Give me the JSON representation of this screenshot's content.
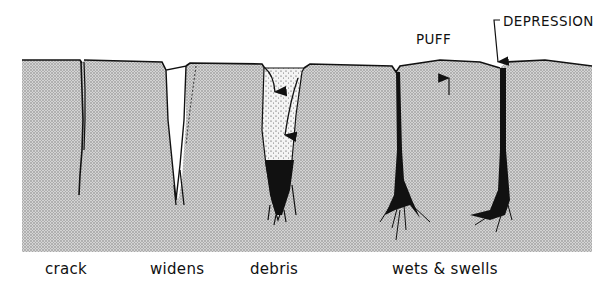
{
  "diagram": {
    "title": "",
    "labels": {
      "stages": [
        {
          "id": "crack",
          "text": "crack",
          "x": 45
        },
        {
          "id": "widens",
          "text": "widens",
          "x": 150
        },
        {
          "id": "debris",
          "text": "debris",
          "x": 250
        },
        {
          "id": "wets-swells",
          "text": "wets & swells",
          "x": 392
        }
      ],
      "callouts": [
        {
          "id": "puff",
          "text": "PUFF",
          "x": 416,
          "y": 35
        },
        {
          "id": "depression",
          "text": "DEPRESSION",
          "x": 503,
          "y": 18
        }
      ]
    },
    "colors": {
      "soil": "#c9c9c9",
      "soil_dot": "#8a8a8a",
      "ink": "#111111",
      "background": "#ffffff"
    }
  }
}
